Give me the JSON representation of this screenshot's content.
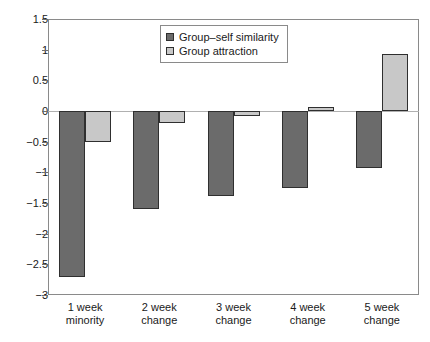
{
  "chart_data": {
    "type": "bar",
    "title": "",
    "xlabel": "",
    "ylabel": "",
    "ylim": [
      -3,
      1.5
    ],
    "ytick_values": [
      1.5,
      1,
      0.5,
      0,
      -0.5,
      -1,
      -1.5,
      -2,
      -2.5,
      -3
    ],
    "ytick_labels": [
      "1.5",
      "1",
      "0.5",
      "0",
      "−0.5",
      "−1",
      "−1.5",
      "−2",
      "−2.5",
      "−3"
    ],
    "grid": false,
    "legend_position": "top-center",
    "categories": [
      "1 week\nminority",
      "2 week\nchange",
      "3 week\nchange",
      "4 week\nchange",
      "5 week\nchange"
    ],
    "series": [
      {
        "name": "Group–self similarity",
        "color": "#6b6b6b",
        "values": [
          -2.71,
          -1.6,
          -1.38,
          -1.25,
          -0.93
        ]
      },
      {
        "name": "Group attraction",
        "color": "#c8c8c8",
        "values": [
          -0.5,
          -0.19,
          -0.08,
          0.07,
          0.93
        ]
      }
    ]
  }
}
